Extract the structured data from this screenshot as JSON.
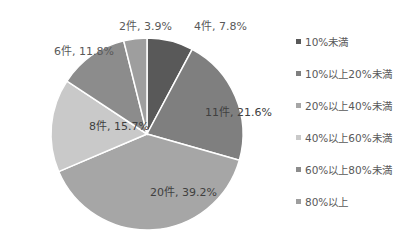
{
  "chart_data": {
    "type": "pie",
    "title": "",
    "start_angle_deg": 0,
    "direction": "clockwise",
    "center": [
      147,
      134
    ],
    "radius": 96,
    "slices": [
      {
        "category": "10%未満",
        "count": 4,
        "percent": 7.8,
        "label": "4件, 7.8%",
        "color": "#595959",
        "label_pos": [
          194,
          30
        ],
        "outside": true
      },
      {
        "category": "10%以上20%未満",
        "count": 11,
        "percent": 21.6,
        "label": "11件, 21.6%",
        "color": "#7f7f7f",
        "label_pos": [
          205,
          116
        ],
        "outside": false
      },
      {
        "category": "20%以上40%未満",
        "count": 20,
        "percent": 39.2,
        "label": "20件, 39.2%",
        "color": "#a6a6a6",
        "label_pos": [
          150,
          196
        ],
        "outside": false
      },
      {
        "category": "40%以上60%未満",
        "count": 8,
        "percent": 15.7,
        "label": "8件, 15.7%",
        "color": "#c9c9c9",
        "label_pos": [
          89,
          130
        ],
        "outside": false
      },
      {
        "category": "60%以上80%未満",
        "count": 6,
        "percent": 11.8,
        "label": "6件, 11.8%",
        "color": "#8c8c8c",
        "label_pos": [
          54,
          55
        ],
        "outside": true
      },
      {
        "category": "80%以上",
        "count": 2,
        "percent": 3.9,
        "label": "2件, 3.9%",
        "color": "#9e9e9e",
        "label_pos": [
          119,
          30
        ],
        "outside": true
      }
    ],
    "legend": {
      "position": "right",
      "entries": [
        "10%未満",
        "10%以上20%未満",
        "20%以上40%未満",
        "40%以上60%未満",
        "60%以上80%未満",
        "80%以上"
      ]
    }
  }
}
